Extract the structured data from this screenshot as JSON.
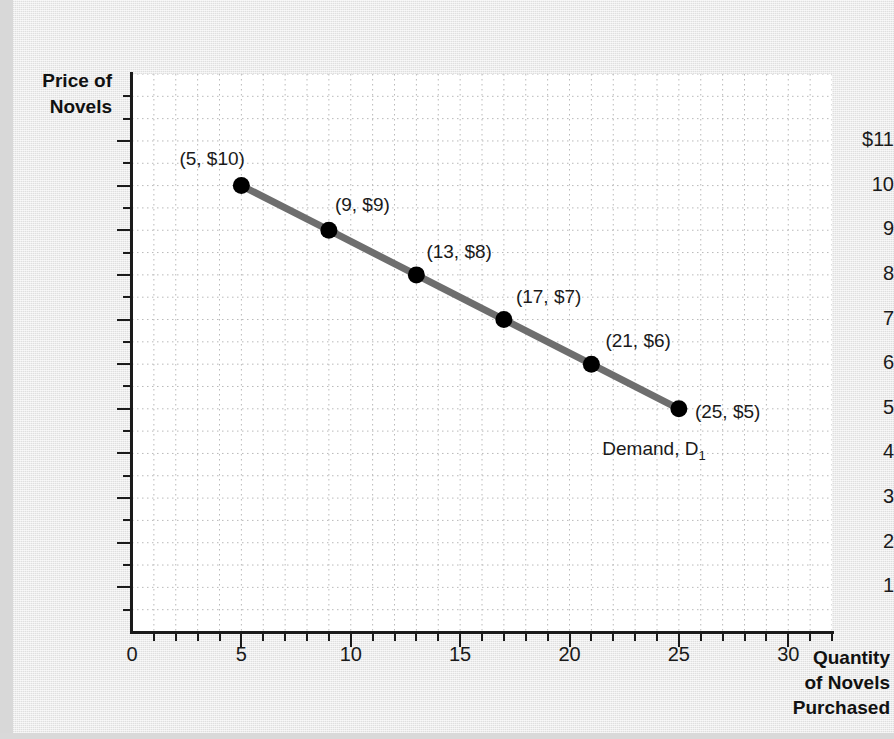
{
  "chart_data": {
    "type": "line",
    "title": "",
    "xlabel": "Quantity of Novels Purchased",
    "ylabel": "Price of Novels",
    "xlim": [
      0,
      32
    ],
    "ylim": [
      0,
      12.5
    ],
    "grid": true,
    "legend_position": "inline-annotation",
    "series": [
      {
        "name": "Demand, D1",
        "color": "#6e6e6e",
        "marker": "filled-circle",
        "marker_color": "#000000",
        "x": [
          5,
          9,
          13,
          17,
          21,
          25
        ],
        "y": [
          10,
          9,
          8,
          7,
          6,
          5
        ],
        "point_labels": [
          "(5, $10)",
          "(9, $9)",
          "(13, $8)",
          "(17, $7)",
          "(21, $6)",
          "(25, $5)"
        ]
      }
    ],
    "annotations": [
      {
        "text": "Demand, D",
        "subscript": "1",
        "x": 21.5,
        "y": 4.35
      }
    ],
    "x_ticks_major": [
      0,
      5,
      10,
      15,
      20,
      25,
      30
    ],
    "x_tick_labels": [
      "0",
      "5",
      "10",
      "15",
      "20",
      "25",
      "30"
    ],
    "x_minor_step": 1,
    "y_ticks_major": [
      1,
      2,
      3,
      4,
      5,
      6,
      7,
      8,
      9,
      10,
      11
    ],
    "y_tick_labels": [
      "1",
      "2",
      "3",
      "4",
      "5",
      "6",
      "7",
      "8",
      "9",
      "10",
      "$11"
    ],
    "y_minor_step": 0.5
  },
  "axes": {
    "y_title_lines": [
      "Price of",
      "Novels"
    ],
    "x_title_lines": [
      "Quantity",
      "of Novels",
      "Purchased"
    ],
    "origin_label": "0"
  },
  "colors": {
    "page_background": "#e6e6e6",
    "plot_background": "#ffffff",
    "axis": "#1a1a1a",
    "grid": "#b9b9b9",
    "demand_line": "#6e6e6e",
    "marker": "#000000",
    "text": "#1a1a1a"
  }
}
